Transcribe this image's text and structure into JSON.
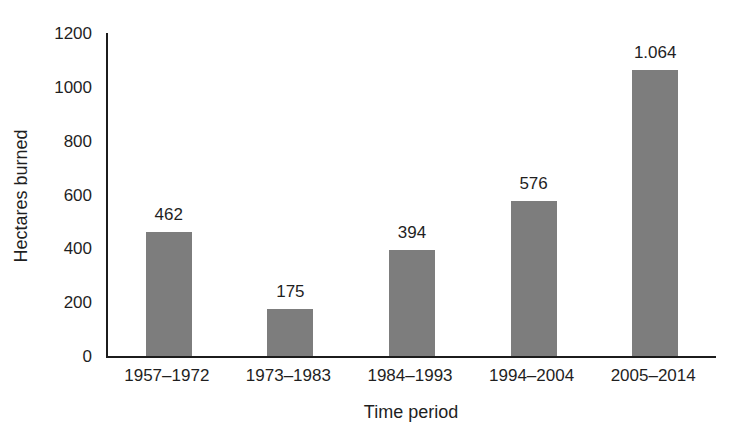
{
  "figure": {
    "background": "#ffffff"
  },
  "chart_data": {
    "type": "bar",
    "title": "",
    "xlabel": "Time period",
    "ylabel": "Hectares burned",
    "categories": [
      "1957–1972",
      "1973–1983",
      "1984–1993",
      "1994–2004",
      "2005–2014"
    ],
    "values": [
      462,
      175,
      394,
      576,
      1064
    ],
    "value_labels": [
      "462",
      "175",
      "394",
      "576",
      "1.064"
    ],
    "ylim": [
      0,
      1200
    ],
    "yticks": [
      0,
      200,
      400,
      600,
      800,
      1000,
      1200
    ],
    "grid": false,
    "legend": false,
    "bar_color": "#7d7d7d",
    "axis_color": "#1c1c1c",
    "text_color": "#1f1f1f"
  }
}
